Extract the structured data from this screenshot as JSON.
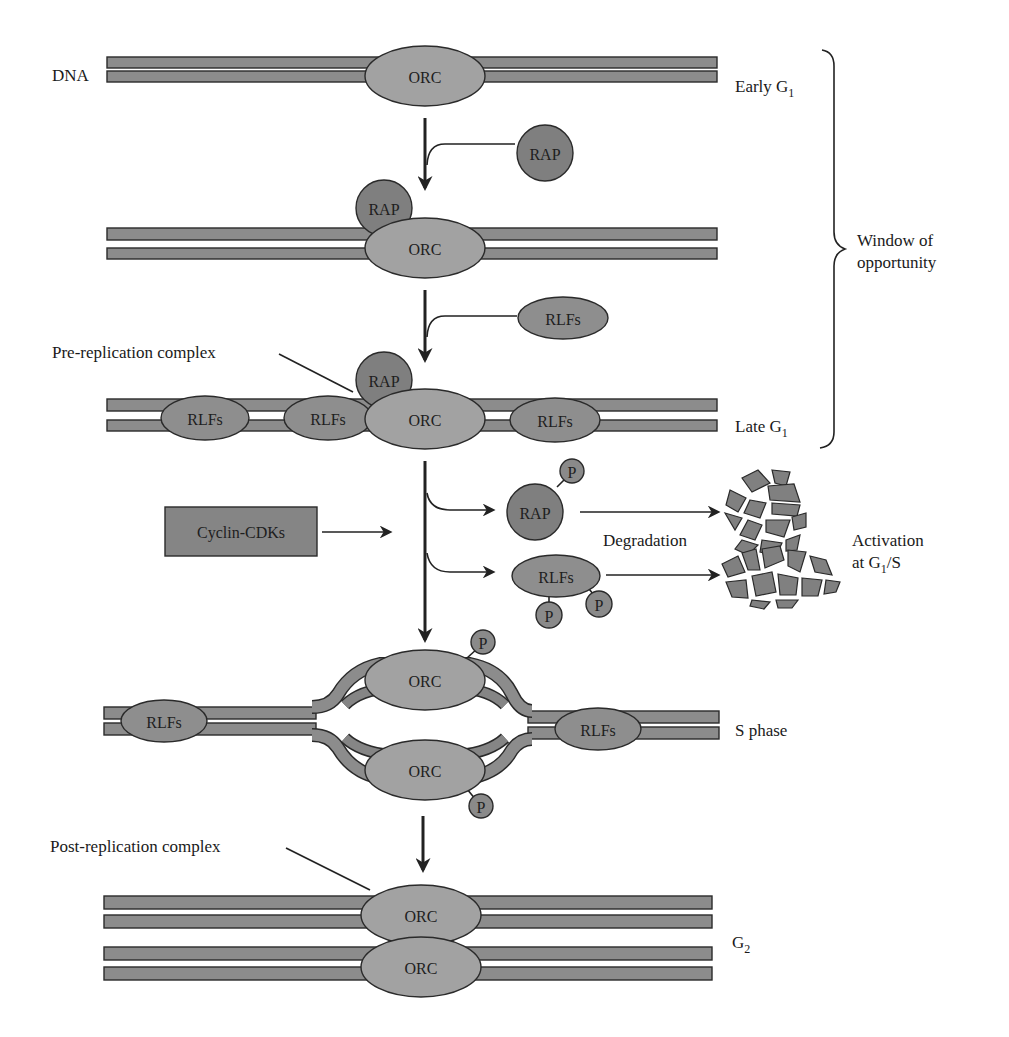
{
  "figure": {
    "colors": {
      "strand": "#8c8c8c",
      "orc": "#a2a2a2",
      "rap": "#7f7f7f",
      "rlfs": "#8e8e8e",
      "outline": "#2a2a2a",
      "background": "#ffffff"
    }
  },
  "labels": {
    "dna": "DNA",
    "orc": "ORC",
    "rap": "RAP",
    "rlfs": "RLFs",
    "p": "P",
    "cyclin_cdks": "Cyclin-CDKs",
    "pre_replication_complex": "Pre-replication complex",
    "post_replication_complex": "Post-replication complex",
    "degradation": "Degradation",
    "activation_line1": "Activation",
    "activation_line2_prefix": "at G",
    "activation_line2_sub": "1",
    "activation_line2_suffix": "/S",
    "window_line1": "Window of",
    "window_line2": "opportunity"
  },
  "stages": [
    {
      "id": "early-g1",
      "label": "Early G",
      "subscript": "1"
    },
    {
      "id": "stage-2",
      "label": "",
      "subscript": ""
    },
    {
      "id": "late-g1",
      "label": "Late G",
      "subscript": "1"
    },
    {
      "id": "s-phase",
      "label": "S phase",
      "subscript": ""
    },
    {
      "id": "g2",
      "label": "G",
      "subscript": "2"
    }
  ]
}
